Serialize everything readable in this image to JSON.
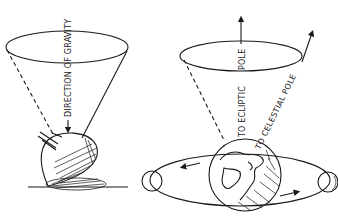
{
  "figure": {
    "left_panel": {
      "subject": "spinning top precessing",
      "labels": {
        "gravity": "DIRECTION OF GRAVITY"
      }
    },
    "right_panel": {
      "subject": "earth precession with moon orbit",
      "labels": {
        "ecliptic_a": "TO ECLIPTIC",
        "ecliptic_b": "POLE",
        "celestial": "TO CELESTIAL POLE"
      }
    },
    "colors": {
      "ink": "#1a1a1a",
      "paper": "#ffffff"
    }
  }
}
